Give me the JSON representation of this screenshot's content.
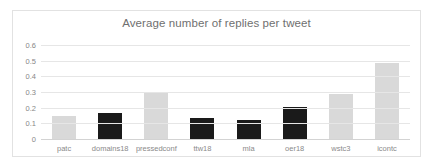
{
  "chart_data": {
    "type": "bar",
    "title": "Average number of replies per tweet",
    "xlabel": "",
    "ylabel": "",
    "ylim": [
      0,
      0.6
    ],
    "yticks": [
      "0",
      "0.1",
      "0.2",
      "0.3",
      "0.4",
      "0.5",
      "0.6"
    ],
    "ytick_values": [
      0,
      0.1,
      0.2,
      0.3,
      0.4,
      0.5,
      0.6
    ],
    "grid": true,
    "legend": "none",
    "categories": [
      "patc",
      "domains18",
      "pressedconf",
      "ttw18",
      "mla",
      "oer18",
      "wstc3",
      "icontc"
    ],
    "values": [
      0.148,
      0.163,
      0.3,
      0.133,
      0.122,
      0.205,
      0.285,
      0.485
    ],
    "bar_colors": [
      "#d9d9d9",
      "#1a1a1a",
      "#d9d9d9",
      "#1a1a1a",
      "#1a1a1a",
      "#1a1a1a",
      "#d9d9d9",
      "#d9d9d9"
    ]
  },
  "colors": {
    "light_bar": "#d9d9d9",
    "dark_bar": "#1a1a1a",
    "gridline": "#e6e6e6",
    "axis": "#d3d3d3",
    "title_text": "#6f6f6f",
    "tick_text": "#878787",
    "frame_border": "#e2e2e2",
    "background": "#ffffff"
  }
}
